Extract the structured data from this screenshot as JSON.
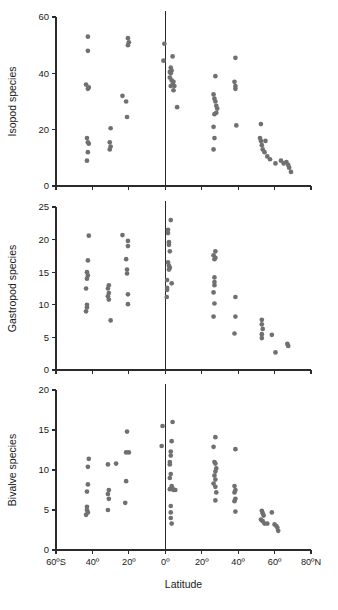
{
  "figure": {
    "name": "latitudinal-species-richness",
    "xlabel": "Latitude",
    "point_color": "#70706f",
    "axis_color": "#2b2b2b",
    "background": "#ffffff",
    "x_tick_labels": [
      "60ºS",
      "40º",
      "20º",
      "0º",
      "20º",
      "40º",
      "60º",
      "80ºN"
    ],
    "x_tick_values": [
      -60,
      -40,
      -20,
      0,
      20,
      40,
      60,
      80
    ],
    "equator_value": 0
  },
  "chart_data": [
    {
      "type": "scatter",
      "name": "isopod",
      "title": "",
      "xlabel": "Latitude",
      "ylabel": "Isopod species",
      "xlim": [
        -60,
        80
      ],
      "ylim": [
        0,
        60
      ],
      "yticks": [
        0,
        20,
        40,
        60
      ],
      "ytick_labels": [
        "0",
        "20",
        "40",
        "60"
      ],
      "xticks": [
        -60,
        -40,
        -20,
        0,
        20,
        40,
        60,
        80
      ],
      "xtick_labels": [
        "60ºS",
        "40º",
        "20º",
        "0º",
        "20º",
        "40º",
        "60º",
        "80ºN"
      ],
      "grid": false,
      "legend": false,
      "annotations": [
        "vertical line at 0º (equator)"
      ],
      "points": [
        [
          -42.5,
          53.0
        ],
        [
          -42.5,
          48.0
        ],
        [
          -43.5,
          36.0
        ],
        [
          -42.0,
          35.0
        ],
        [
          -42.5,
          34.5
        ],
        [
          -43.0,
          17.0
        ],
        [
          -42.5,
          15.5
        ],
        [
          -42.0,
          15.0
        ],
        [
          -42.5,
          12.0
        ],
        [
          -43.0,
          9.0
        ],
        [
          -30.0,
          20.5
        ],
        [
          -30.5,
          15.5
        ],
        [
          -30.0,
          14.0
        ],
        [
          -30.5,
          13.0
        ],
        [
          -20.5,
          52.5
        ],
        [
          -20.0,
          51.0
        ],
        [
          -20.5,
          50.0
        ],
        [
          -23.5,
          32.0
        ],
        [
          -21.5,
          30.0
        ],
        [
          -21.0,
          24.5
        ],
        [
          -0.5,
          50.5
        ],
        [
          -1.0,
          44.5
        ],
        [
          4.0,
          46.0
        ],
        [
          3.0,
          42.0
        ],
        [
          3.5,
          41.0
        ],
        [
          2.5,
          40.5
        ],
        [
          3.0,
          40.0
        ],
        [
          2.5,
          38.5
        ],
        [
          3.5,
          37.5
        ],
        [
          4.5,
          37.0
        ],
        [
          4.0,
          36.0
        ],
        [
          3.0,
          35.5
        ],
        [
          5.0,
          35.5
        ],
        [
          4.5,
          34.0
        ],
        [
          6.5,
          28.0
        ],
        [
          27.5,
          39.0
        ],
        [
          26.5,
          32.5
        ],
        [
          27.0,
          31.0
        ],
        [
          27.5,
          30.0
        ],
        [
          28.0,
          28.5
        ],
        [
          28.5,
          27.5
        ],
        [
          28.0,
          26.0
        ],
        [
          27.0,
          25.5
        ],
        [
          26.5,
          21.0
        ],
        [
          27.0,
          17.0
        ],
        [
          26.5,
          13.0
        ],
        [
          38.5,
          45.5
        ],
        [
          38.0,
          37.0
        ],
        [
          38.5,
          35.5
        ],
        [
          38.5,
          34.5
        ],
        [
          39.0,
          21.5
        ],
        [
          52.5,
          22.0
        ],
        [
          52.0,
          17.0
        ],
        [
          52.5,
          16.0
        ],
        [
          55.0,
          16.0
        ],
        [
          53.0,
          14.5
        ],
        [
          53.5,
          13.0
        ],
        [
          54.5,
          12.0
        ],
        [
          56.0,
          10.5
        ],
        [
          57.5,
          9.5
        ],
        [
          60.5,
          8.0
        ],
        [
          63.5,
          9.0
        ],
        [
          65.0,
          8.0
        ],
        [
          66.5,
          8.5
        ],
        [
          67.5,
          7.5
        ],
        [
          68.0,
          6.5
        ],
        [
          69.0,
          5.0
        ]
      ]
    },
    {
      "type": "scatter",
      "name": "gastropod",
      "title": "",
      "xlabel": "Latitude",
      "ylabel": "Gastropod species",
      "xlim": [
        -60,
        80
      ],
      "ylim": [
        0,
        25
      ],
      "yticks": [
        0,
        5,
        10,
        15,
        20,
        25
      ],
      "ytick_labels": [
        "0",
        "5",
        "10",
        "15",
        "20",
        "25"
      ],
      "xticks": [
        -60,
        -40,
        -20,
        0,
        20,
        40,
        60,
        80
      ],
      "xtick_labels": [
        "60ºS",
        "40º",
        "20º",
        "0º",
        "20º",
        "40º",
        "60º",
        "80ºN"
      ],
      "grid": false,
      "legend": false,
      "annotations": [
        "vertical line at 0º (equator)"
      ],
      "points": [
        [
          -42.0,
          20.6
        ],
        [
          -42.5,
          16.8
        ],
        [
          -43.0,
          15.0
        ],
        [
          -42.5,
          14.5
        ],
        [
          -43.0,
          14.0
        ],
        [
          -43.5,
          12.5
        ],
        [
          -43.0,
          10.0
        ],
        [
          -43.0,
          9.6
        ],
        [
          -43.5,
          9.0
        ],
        [
          -31.0,
          13.0
        ],
        [
          -31.5,
          12.5
        ],
        [
          -31.0,
          11.8
        ],
        [
          -31.5,
          11.3
        ],
        [
          -31.0,
          10.8
        ],
        [
          -30.0,
          7.6
        ],
        [
          -23.5,
          20.7
        ],
        [
          -20.5,
          19.8
        ],
        [
          -20.5,
          19.0
        ],
        [
          -21.5,
          17.0
        ],
        [
          -21.0,
          15.4
        ],
        [
          -21.0,
          14.8
        ],
        [
          -20.5,
          11.6
        ],
        [
          -20.5,
          10.1
        ],
        [
          3.0,
          23.0
        ],
        [
          1.5,
          21.5
        ],
        [
          1.5,
          21.0
        ],
        [
          2.0,
          19.6
        ],
        [
          2.0,
          19.2
        ],
        [
          2.5,
          18.2
        ],
        [
          1.5,
          16.5
        ],
        [
          2.0,
          16.0
        ],
        [
          2.5,
          15.7
        ],
        [
          2.0,
          15.4
        ],
        [
          1.0,
          13.8
        ],
        [
          3.5,
          13.3
        ],
        [
          1.0,
          12.6
        ],
        [
          1.0,
          12.3
        ],
        [
          0.8,
          11.2
        ],
        [
          27.5,
          18.2
        ],
        [
          26.5,
          17.6
        ],
        [
          27.5,
          17.2
        ],
        [
          27.0,
          17.0
        ],
        [
          27.0,
          14.2
        ],
        [
          27.0,
          13.5
        ],
        [
          27.0,
          13.0
        ],
        [
          26.5,
          11.9
        ],
        [
          27.0,
          10.2
        ],
        [
          26.5,
          8.2
        ],
        [
          38.5,
          11.2
        ],
        [
          38.5,
          8.2
        ],
        [
          38.0,
          5.6
        ],
        [
          53.0,
          7.7
        ],
        [
          53.0,
          7.0
        ],
        [
          53.5,
          6.3
        ],
        [
          53.0,
          5.5
        ],
        [
          53.0,
          4.9
        ],
        [
          58.5,
          5.4
        ],
        [
          60.5,
          2.7
        ],
        [
          67.0,
          4.0
        ],
        [
          67.5,
          3.7
        ]
      ]
    },
    {
      "type": "scatter",
      "name": "bivalve",
      "title": "",
      "xlabel": "Latitude",
      "ylabel": "Bivalve species",
      "xlim": [
        -60,
        80
      ],
      "ylim": [
        0,
        20
      ],
      "yticks": [
        0,
        5,
        10,
        15,
        20
      ],
      "ytick_labels": [
        "0",
        "5",
        "10",
        "15",
        "20"
      ],
      "xticks": [
        -60,
        -40,
        -20,
        0,
        20,
        40,
        60,
        80
      ],
      "xtick_labels": [
        "60ºS",
        "40º",
        "20º",
        "0º",
        "20º",
        "40º",
        "60º",
        "80ºN"
      ],
      "grid": false,
      "legend": false,
      "annotations": [
        "vertical line at 0º (equator)"
      ],
      "points": [
        [
          -42.0,
          11.4
        ],
        [
          -42.5,
          10.4
        ],
        [
          -42.5,
          8.2
        ],
        [
          -43.0,
          7.3
        ],
        [
          -43.0,
          5.4
        ],
        [
          -43.0,
          5.0
        ],
        [
          -42.5,
          4.7
        ],
        [
          -43.5,
          4.4
        ],
        [
          -31.5,
          10.7
        ],
        [
          -31.0,
          7.5
        ],
        [
          -31.5,
          7.0
        ],
        [
          -31.0,
          6.4
        ],
        [
          -31.5,
          5.0
        ],
        [
          -27.0,
          10.8
        ],
        [
          -21.0,
          14.8
        ],
        [
          -20.0,
          12.2
        ],
        [
          -21.5,
          12.2
        ],
        [
          -21.5,
          8.6
        ],
        [
          -22.0,
          5.9
        ],
        [
          -1.5,
          15.5
        ],
        [
          -2.0,
          13.0
        ],
        [
          4.0,
          16.0
        ],
        [
          3.5,
          13.6
        ],
        [
          3.0,
          12.3
        ],
        [
          3.0,
          11.8
        ],
        [
          2.5,
          11.0
        ],
        [
          2.5,
          10.7
        ],
        [
          3.0,
          9.5
        ],
        [
          2.5,
          9.0
        ],
        [
          3.5,
          8.0
        ],
        [
          4.0,
          7.7
        ],
        [
          4.5,
          7.5
        ],
        [
          5.5,
          7.5
        ],
        [
          2.5,
          7.6
        ],
        [
          3.0,
          5.5
        ],
        [
          3.0,
          4.7
        ],
        [
          3.0,
          4.0
        ],
        [
          3.5,
          3.3
        ],
        [
          27.5,
          14.1
        ],
        [
          26.5,
          12.9
        ],
        [
          27.0,
          11.0
        ],
        [
          27.5,
          10.8
        ],
        [
          28.0,
          10.2
        ],
        [
          27.5,
          9.8
        ],
        [
          27.0,
          9.3
        ],
        [
          27.5,
          8.8
        ],
        [
          26.5,
          8.3
        ],
        [
          27.5,
          7.9
        ],
        [
          28.0,
          7.2
        ],
        [
          27.5,
          6.2
        ],
        [
          38.5,
          12.6
        ],
        [
          38.0,
          8.0
        ],
        [
          38.5,
          7.5
        ],
        [
          38.0,
          7.2
        ],
        [
          38.5,
          6.4
        ],
        [
          38.0,
          6.1
        ],
        [
          38.5,
          4.8
        ],
        [
          53.0,
          4.9
        ],
        [
          53.5,
          4.6
        ],
        [
          54.0,
          4.3
        ],
        [
          52.5,
          3.8
        ],
        [
          53.5,
          3.6
        ],
        [
          54.5,
          3.3
        ],
        [
          56.0,
          3.3
        ],
        [
          58.5,
          4.7
        ],
        [
          60.0,
          3.2
        ],
        [
          61.0,
          3.0
        ],
        [
          61.5,
          2.8
        ],
        [
          62.0,
          2.4
        ]
      ]
    }
  ]
}
